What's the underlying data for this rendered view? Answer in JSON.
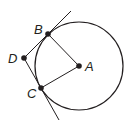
{
  "diagram": {
    "type": "geometry",
    "stroke_color": "#231f20",
    "circle": {
      "center": "A",
      "cx": 79,
      "cy": 66,
      "r": 44
    },
    "points": [
      {
        "id": "A",
        "label": "A",
        "x": 79,
        "y": 66,
        "label_x": 85,
        "label_y": 71
      },
      {
        "id": "B",
        "label": "B",
        "x": 48,
        "y": 34,
        "label_x": 34,
        "label_y": 34
      },
      {
        "id": "C",
        "label": "C",
        "x": 41,
        "y": 88,
        "label_x": 27,
        "label_y": 98
      },
      {
        "id": "D",
        "label": "D",
        "x": 24,
        "y": 58,
        "label_x": 8,
        "label_y": 63
      }
    ],
    "segments": [
      {
        "from": "A",
        "to": "B"
      },
      {
        "from": "A",
        "to": "C"
      }
    ],
    "tangent_lines": [
      {
        "through": [
          "D",
          "B"
        ],
        "x1": 24,
        "y1": 58,
        "x2": 71,
        "y2": 11
      },
      {
        "through": [
          "D",
          "C"
        ],
        "x1": 24,
        "y1": 58,
        "x2": 59,
        "y2": 120
      }
    ]
  }
}
